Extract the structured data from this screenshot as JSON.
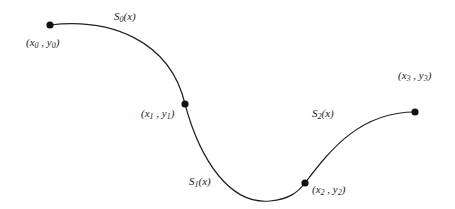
{
  "diagram": {
    "curve_color": "#222222",
    "point_color": "#111111",
    "knots": [
      {
        "id": "p0",
        "label": "(x0 , y0)",
        "var": "x",
        "sub": "0",
        "var2": "y",
        "sub2": "0",
        "cx": 50,
        "cy": 25,
        "lx": 26,
        "ly": 46
      },
      {
        "id": "p1",
        "label": "(x1 , y1)",
        "var": "x",
        "sub": "1",
        "var2": "y",
        "sub2": "1",
        "cx": 185,
        "cy": 104,
        "lx": 141,
        "ly": 117
      },
      {
        "id": "p2",
        "label": "(x2 , y2)",
        "var": "x",
        "sub": "2",
        "var2": "y",
        "sub2": "2",
        "cx": 305,
        "cy": 183,
        "lx": 312,
        "ly": 193
      },
      {
        "id": "p3",
        "label": "(x3 , y3)",
        "var": "x",
        "sub": "3",
        "var2": "y",
        "sub2": "3",
        "cx": 415,
        "cy": 112,
        "lx": 398,
        "ly": 79
      }
    ],
    "segments": [
      {
        "id": "s0",
        "label": "S0(x)",
        "name": "S",
        "sub": "0",
        "arg": "(x)",
        "lx": 114,
        "ly": 20
      },
      {
        "id": "s1",
        "label": "S1(x)",
        "name": "S",
        "sub": "1",
        "arg": "(x)",
        "lx": 189,
        "ly": 185
      },
      {
        "id": "s2",
        "label": "S2(x)",
        "name": "S",
        "sub": "2",
        "arg": "(x)",
        "lx": 312,
        "ly": 117
      }
    ]
  }
}
